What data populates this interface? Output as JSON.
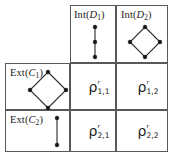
{
  "figure": {
    "type": "matrix-table",
    "columns": [
      {
        "id": "c0",
        "label": ""
      },
      {
        "id": "c1",
        "label_prefix": "Int",
        "label_symbol": "D",
        "label_sub": "1",
        "label_full": "Int (D1)"
      },
      {
        "id": "c2",
        "label_prefix": "Int",
        "label_symbol": "D",
        "label_sub": "2",
        "label_full": "Int (D2)"
      }
    ],
    "rows": [
      {
        "id": "r1",
        "label_prefix": "Ext",
        "label_symbol": "C",
        "label_sub": "1",
        "label_full": "Ext (C1)"
      },
      {
        "id": "r2",
        "label_prefix": "Ext",
        "label_symbol": "C",
        "label_sub": "2",
        "label_full": "Ext (C2)"
      }
    ],
    "header_labels": {
      "int1_prefix": "Int",
      "int1_open": "(",
      "int1_symbol": "D",
      "int1_sub": "1",
      "int1_close": ")",
      "int2_prefix": "Int",
      "int2_open": "(",
      "int2_symbol": "D",
      "int2_sub": "2",
      "int2_close": ")",
      "ext1_prefix": "Ext",
      "ext1_open": "(",
      "ext1_symbol": "C",
      "ext1_sub": "1",
      "ext1_close": ")",
      "ext2_prefix": "Ext",
      "ext2_open": "(",
      "ext2_symbol": "C",
      "ext2_sub": "2",
      "ext2_close": ")"
    },
    "cells": [
      {
        "id": "cell_1_1",
        "base": "ρ",
        "superscript": "r",
        "subscript": "1,1"
      },
      {
        "id": "cell_1_2",
        "base": "ρ",
        "superscript": "r",
        "subscript": "1,2"
      },
      {
        "id": "cell_2_1",
        "base": "ρ",
        "superscript": "r",
        "subscript": "2,1"
      },
      {
        "id": "cell_2_2",
        "base": "ρ",
        "superscript": "r",
        "subscript": "2,2"
      }
    ],
    "graphs": {
      "int1": {
        "shape": "path-3-nodes-vertical",
        "node_count": 3,
        "edge_count": 2
      },
      "int2": {
        "shape": "diamond-4-nodes",
        "node_count": 4,
        "edge_count": 4
      },
      "ext1": {
        "shape": "diamond-4-nodes",
        "node_count": 4,
        "edge_count": 4
      },
      "ext2": {
        "shape": "path-2-nodes-vertical",
        "node_count": 2,
        "edge_count": 1
      }
    },
    "colors": {
      "border": "#58585a",
      "node": "#151515",
      "edge": "#2a2a2a",
      "text": "#1a1a1a",
      "background": "#ffffff"
    }
  }
}
